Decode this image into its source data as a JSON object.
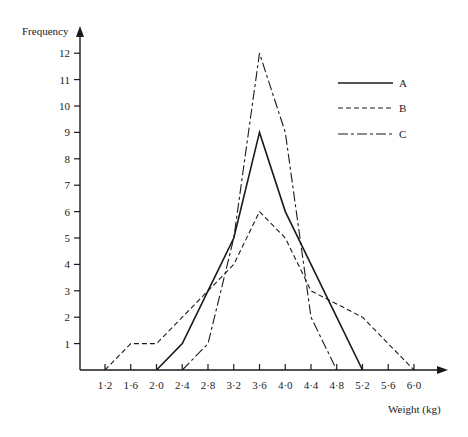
{
  "chart_data": {
    "type": "line",
    "title": "",
    "xlabel": "Weight (kg)",
    "ylabel": "Frequency",
    "x_ticks": [
      "1·2",
      "1·6",
      "2·0",
      "2·4",
      "2·8",
      "3·2",
      "3·6",
      "4·0",
      "4·4",
      "4·8",
      "5·2",
      "5·6",
      "6·0"
    ],
    "x_values": [
      1.2,
      1.6,
      2.0,
      2.4,
      2.8,
      3.2,
      3.6,
      4.0,
      4.4,
      4.8,
      5.2,
      5.6,
      6.0
    ],
    "y_ticks": [
      "1",
      "2",
      "3",
      "4",
      "5",
      "6",
      "7",
      "8",
      "9",
      "10",
      "11",
      "12"
    ],
    "xlim": [
      0.8,
      6.6
    ],
    "ylim": [
      0,
      13
    ],
    "grid": false,
    "legend_position": "upper right",
    "series": [
      {
        "name": "A",
        "style": "solid",
        "x": [
          2.0,
          2.4,
          2.8,
          3.2,
          3.6,
          4.0,
          4.4,
          4.8,
          5.2
        ],
        "y": [
          0,
          1,
          3,
          5,
          9,
          6,
          4,
          2,
          0
        ]
      },
      {
        "name": "B",
        "style": "dashed",
        "x": [
          1.2,
          1.6,
          2.0,
          2.4,
          2.8,
          3.2,
          3.6,
          4.0,
          4.4,
          4.8,
          5.2,
          5.6,
          6.0
        ],
        "y": [
          0,
          1,
          1,
          2,
          3,
          4,
          6,
          5,
          3,
          2.5,
          2,
          1,
          0
        ]
      },
      {
        "name": "C",
        "style": "dash-dot",
        "x": [
          2.4,
          2.8,
          3.2,
          3.6,
          4.0,
          4.4,
          4.8
        ],
        "y": [
          0,
          1,
          5,
          12,
          9,
          2,
          0
        ]
      }
    ]
  },
  "legend": {
    "items": [
      {
        "label": "A",
        "style": "solid"
      },
      {
        "label": "B",
        "style": "dashed"
      },
      {
        "label": "C",
        "style": "dash-dot"
      }
    ]
  },
  "colors": {
    "ink": "#1a1a1a",
    "background": "#ffffff"
  }
}
